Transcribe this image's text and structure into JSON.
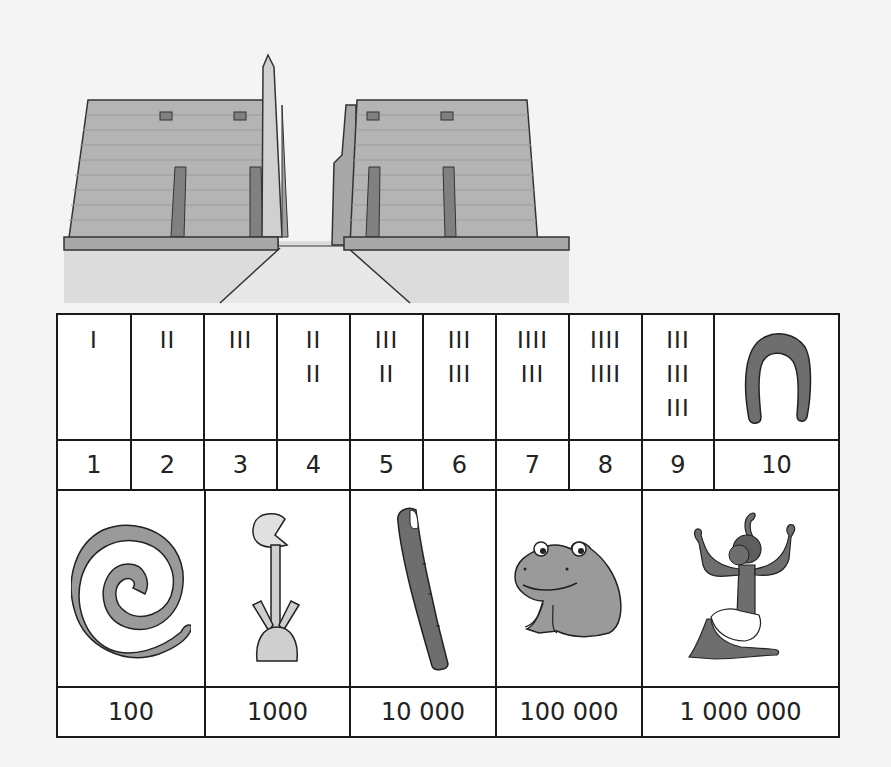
{
  "illustration": {
    "name": "Egyptian temple pylon with obelisk",
    "colors": {
      "wall": "#b4b4b4",
      "window": "#808080",
      "ground": "#dcdcdc",
      "base": "#a8a8a8",
      "outline": "#333333"
    }
  },
  "table": {
    "units": [
      {
        "value": "1",
        "tally": [
          "I"
        ]
      },
      {
        "value": "2",
        "tally": [
          "II"
        ]
      },
      {
        "value": "3",
        "tally": [
          "III"
        ]
      },
      {
        "value": "4",
        "tally": [
          "II",
          "II"
        ]
      },
      {
        "value": "5",
        "tally": [
          "III",
          "II"
        ]
      },
      {
        "value": "6",
        "tally": [
          "III",
          "III"
        ]
      },
      {
        "value": "7",
        "tally": [
          "IIII",
          "III"
        ]
      },
      {
        "value": "8",
        "tally": [
          "IIII",
          "IIII"
        ]
      },
      {
        "value": "9",
        "tally": [
          "III",
          "III",
          "III"
        ]
      },
      {
        "value": "10",
        "symbol": "heel-bone-icon"
      }
    ],
    "powers": [
      {
        "value": "100",
        "symbol": "coil-of-rope-icon"
      },
      {
        "value": "1000",
        "symbol": "lotus-plant-icon"
      },
      {
        "value": "10000",
        "display": "10 000",
        "symbol": "finger-icon"
      },
      {
        "value": "100000",
        "display": "100 000",
        "symbol": "frog-icon"
      },
      {
        "value": "1000000",
        "display": "1 000 000",
        "symbol": "kneeling-god-icon"
      }
    ],
    "colors": {
      "border": "#1a1a1a",
      "symbol_dark": "#6e6e6e",
      "symbol_mid": "#9a9a9a",
      "symbol_light": "#cfcfcf"
    }
  }
}
